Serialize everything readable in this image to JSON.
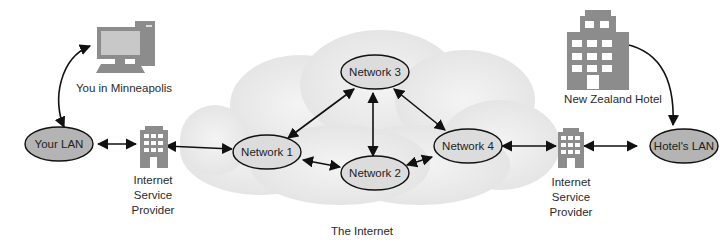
{
  "diagram": {
    "internet_label": "The Internet",
    "nodes": {
      "your_lan": {
        "label": "Your LAN",
        "fill": "#b4b4b4"
      },
      "hotels_lan": {
        "label": "Hotel's LAN",
        "fill": "#b4b4b4"
      },
      "network1": {
        "label": "Network 1",
        "fill": "#dcdcdc"
      },
      "network2": {
        "label": "Network 2",
        "fill": "#dcdcdc"
      },
      "network3": {
        "label": "Network 3",
        "fill": "#dcdcdc"
      },
      "network4": {
        "label": "Network 4",
        "fill": "#dcdcdc"
      }
    },
    "icons": {
      "computer": {
        "label": "You in Minneapolis",
        "icon": "desktop-computer-icon"
      },
      "hotel": {
        "label": "New Zealand Hotel",
        "icon": "hotel-building-icon"
      },
      "isp_left": {
        "label_lines": [
          "Internet",
          "Service",
          "Provider"
        ],
        "icon": "isp-building-icon"
      },
      "isp_right": {
        "label_lines": [
          "Internet",
          "Service",
          "Provider"
        ],
        "icon": "isp-building-icon"
      }
    },
    "edges": [
      [
        "computer",
        "your_lan"
      ],
      [
        "your_lan",
        "isp_left"
      ],
      [
        "isp_left",
        "network1"
      ],
      [
        "network1",
        "network3"
      ],
      [
        "network1",
        "network2"
      ],
      [
        "network3",
        "network2"
      ],
      [
        "network3",
        "network4"
      ],
      [
        "network2",
        "network4"
      ],
      [
        "network4",
        "isp_right"
      ],
      [
        "isp_right",
        "hotels_lan"
      ],
      [
        "hotel",
        "hotels_lan"
      ]
    ],
    "colors": {
      "cloud": "#e9e9e9",
      "icon": "#8c8c8c",
      "line": "#111111"
    }
  }
}
